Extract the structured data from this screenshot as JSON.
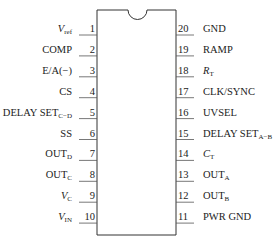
{
  "diagram": {
    "type": "ic-pinout",
    "package": "20-pin DIP",
    "left_pins": [
      {
        "num": "1",
        "label": "V",
        "sub": "ref",
        "italic": true
      },
      {
        "num": "2",
        "label": "COMP",
        "sub": "",
        "italic": false
      },
      {
        "num": "3",
        "label": "E/A(−)",
        "sub": "",
        "italic": false
      },
      {
        "num": "4",
        "label": "CS",
        "sub": "",
        "italic": false
      },
      {
        "num": "5",
        "label": "DELAY SET",
        "sub": "C−D",
        "italic": false
      },
      {
        "num": "6",
        "label": "SS",
        "sub": "",
        "italic": false
      },
      {
        "num": "7",
        "label": "OUT",
        "sub": "D",
        "italic": false
      },
      {
        "num": "8",
        "label": "OUT",
        "sub": "C",
        "italic": false
      },
      {
        "num": "9",
        "label": "V",
        "sub": "C",
        "italic": true
      },
      {
        "num": "10",
        "label": "V",
        "sub": "IN",
        "italic": true
      }
    ],
    "right_pins": [
      {
        "num": "20",
        "label": "GND",
        "sub": "",
        "italic": false
      },
      {
        "num": "19",
        "label": "RAMP",
        "sub": "",
        "italic": false
      },
      {
        "num": "18",
        "label": "R",
        "sub": "T",
        "italic": true
      },
      {
        "num": "17",
        "label": "CLK/SYNC",
        "sub": "",
        "italic": false
      },
      {
        "num": "16",
        "label": "UVSEL",
        "sub": "",
        "italic": false
      },
      {
        "num": "15",
        "label": "DELAY SET",
        "sub": "A−B",
        "italic": false
      },
      {
        "num": "14",
        "label": "C",
        "sub": "T",
        "italic": true
      },
      {
        "num": "13",
        "label": "OUT",
        "sub": "A",
        "italic": false
      },
      {
        "num": "12",
        "label": "OUT",
        "sub": "B",
        "italic": false
      },
      {
        "num": "11",
        "label": "PWR GND",
        "sub": "",
        "italic": false
      }
    ]
  }
}
